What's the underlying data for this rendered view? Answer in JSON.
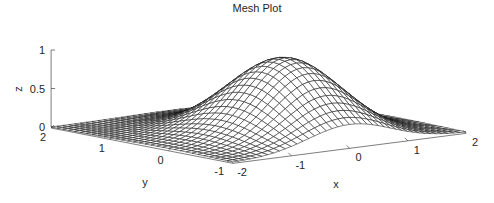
{
  "chart_data": {
    "type": "mesh",
    "title": "Mesh Plot",
    "xlabel": "x",
    "ylabel": "y",
    "zlabel": "z",
    "function": "z = exp(-(x^2 + y^2))",
    "x_range": [
      -2,
      2
    ],
    "y_range": [
      -1.1,
      2
    ],
    "z_range": [
      0,
      1
    ],
    "x_ticks": [
      "-2",
      "-1",
      "0",
      "1",
      "2"
    ],
    "y_ticks": [
      "2",
      "1",
      "0",
      "-1"
    ],
    "z_ticks": [
      "0",
      "0.5",
      "1"
    ],
    "grid_lines_x": 41,
    "grid_lines_y": 32,
    "edge_color": "#1a1a1a",
    "face_color": "#ffffff"
  }
}
